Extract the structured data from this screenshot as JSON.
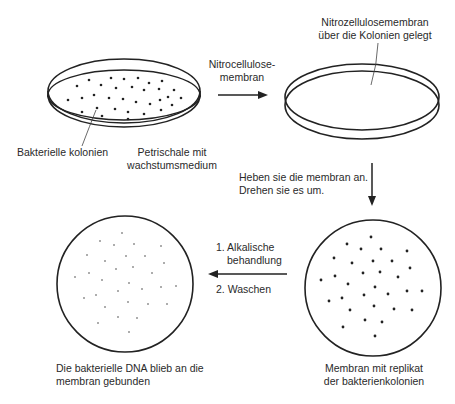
{
  "diagram": {
    "type": "process-flow",
    "steps": [
      {
        "id": "petri-dish",
        "labels": [
          "Bakterielle kolonien",
          "Petrischale mit wachstumsmedium"
        ]
      },
      {
        "id": "membrane-on-dish",
        "label": "Nitrozellulosemembran über die Kolonien gelegt"
      },
      {
        "id": "membrane-replica",
        "label": "Membran mit replikat der bakterienkolonien"
      },
      {
        "id": "membrane-dna",
        "label": "Die bakterielle DNA blieb an die membran gebunden"
      }
    ],
    "arrows": [
      {
        "from": "petri-dish",
        "to": "membrane-on-dish",
        "label": "Nitrocellulose-membran"
      },
      {
        "from": "membrane-on-dish",
        "to": "membrane-replica",
        "label": "Heben sie die membran an. Drehen sie es um."
      },
      {
        "from": "membrane-replica",
        "to": "membrane-dna",
        "label": "1. Alkalische behandlung / 2. Waschen"
      }
    ]
  },
  "labels": {
    "colonies": "Bakterielle kolonien",
    "petri_line1": "Petrischale mit",
    "petri_line2": "wachstumsmedium",
    "arrow1_line1": "Nitrocellulose-",
    "arrow1_line2": "membran",
    "membrane_line1": "Nitrozellulosemembran",
    "membrane_line2": "über die Kolonien gelegt",
    "lift_line1": "Heben sie die membran an.",
    "lift_line2": "Drehen sie es um.",
    "step1": "1. Alkalische",
    "step1b": "behandlung",
    "step2": "2. Waschen",
    "replica_line1": "Membran mit replikat",
    "replica_line2": "der bakterienkolonien",
    "dna_line1": "Die bakterielle DNA blieb an die",
    "dna_line2": "membran gebunden"
  }
}
